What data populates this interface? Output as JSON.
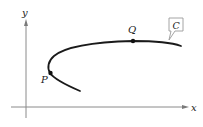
{
  "figure": {
    "type": "parametric-curve-sketch",
    "axes": {
      "x_label": "x",
      "y_label": "y"
    },
    "curve": {
      "name": "C",
      "color": "#1a1a1a"
    },
    "points": [
      {
        "name": "P",
        "label": "P"
      },
      {
        "name": "Q",
        "label": "Q"
      }
    ],
    "callout": {
      "label": "C",
      "border_color": "#9a9a9a"
    },
    "colors": {
      "axis": "#8a8a8a",
      "curve": "#1a1a1a",
      "text": "#222222",
      "background": "#ffffff"
    }
  }
}
